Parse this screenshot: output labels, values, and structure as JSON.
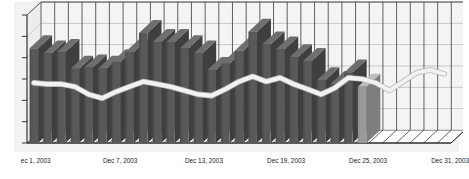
{
  "chart_data": {
    "type": "bar",
    "title": "",
    "subtitle": "",
    "xlabel": "",
    "ylabel": "",
    "grid": true,
    "legend": "none",
    "style": "3d-perspective",
    "x_tick_labels": [
      "ec 1, 2003",
      "Dec 7, 2003",
      "Dec 13, 2003",
      "Dec 19, 2003",
      "Dec 25, 2003",
      "Dec 31, 2003"
    ],
    "x_tick_positions": [
      0,
      6,
      12,
      18,
      24,
      30
    ],
    "y_axis": {
      "labels_shown": false,
      "tick_count": 6,
      "ylim": [
        0,
        100
      ]
    },
    "categories": [
      "Dec 1, 2003",
      "Dec 2, 2003",
      "Dec 3, 2003",
      "Dec 4, 2003",
      "Dec 5, 2003",
      "Dec 6, 2003",
      "Dec 7, 2003",
      "Dec 8, 2003",
      "Dec 9, 2003",
      "Dec 10, 2003",
      "Dec 11, 2003",
      "Dec 12, 2003",
      "Dec 13, 2003",
      "Dec 14, 2003",
      "Dec 15, 2003",
      "Dec 16, 2003",
      "Dec 17, 2003",
      "Dec 18, 2003",
      "Dec 19, 2003",
      "Dec 20, 2003",
      "Dec 21, 2003",
      "Dec 22, 2003",
      "Dec 23, 2003",
      "Dec 24, 2003",
      "Dec 25, 2003",
      "Dec 26, 2003",
      "Dec 27, 2003",
      "Dec 28, 2003",
      "Dec 29, 2003",
      "Dec 30, 2003",
      "Dec 31, 2003"
    ],
    "series": [
      {
        "name": "Volume",
        "type": "bar",
        "color": "#595959",
        "top_color": "#6e6e6e",
        "side_color": "#3f3f3f",
        "last_bar_color": "#9a9a9a",
        "values": [
          74,
          70,
          71,
          58,
          59,
          58,
          63,
          71,
          86,
          79,
          79,
          74,
          70,
          57,
          62,
          72,
          87,
          77,
          73,
          67,
          64,
          49,
          46,
          55,
          44,
          null,
          null,
          null,
          null,
          null,
          null
        ]
      },
      {
        "name": "Price",
        "type": "line",
        "color": "#f2f2f2",
        "outline_color": "#b8b8b8",
        "width": 4,
        "values": [
          47,
          46,
          46,
          44,
          38,
          35,
          40,
          44,
          48,
          46,
          44,
          41,
          38,
          37,
          42,
          48,
          52,
          48,
          51,
          46,
          42,
          38,
          43,
          51,
          50,
          47,
          41,
          48,
          55,
          57,
          54
        ]
      }
    ]
  },
  "axis": {
    "x_label_left": "ec 1, 2003",
    "x_label_2": "Dec 7, 2003",
    "x_label_3": "Dec 13, 2003",
    "x_label_4": "Dec 19, 2003",
    "x_label_5": "Dec 25, 2003",
    "x_label_6": "Dec 31, 2003"
  },
  "colors": {
    "background": "#ffffff",
    "plot_background": "#f4f4f4",
    "grid": "#3a3a3a",
    "grid_light": "#a8a8a8",
    "bar": "#595959",
    "bar_top": "#6e6e6e",
    "bar_side": "#3e3e3e",
    "bar_projected": "#9c9c9c",
    "line": "#f0f0f0",
    "axis": "#202020",
    "text": "#1a1a1a"
  }
}
